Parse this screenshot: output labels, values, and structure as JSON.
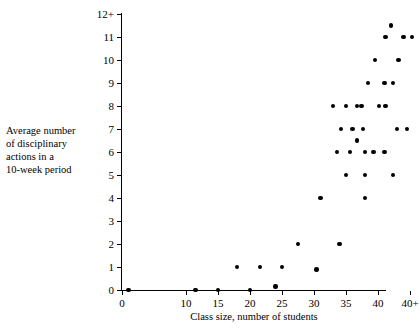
{
  "chart_data": {
    "type": "scatter",
    "title": "",
    "xlabel": "Class size, number of students",
    "ylabel": "Average number\nof disciplinary\nactions in a\n10-week period",
    "ylabel_lines": [
      "Average number",
      "of disciplinary",
      "actions in a",
      "10-week period"
    ],
    "xticks": [
      0,
      10,
      15,
      20,
      25,
      30,
      35,
      40,
      45
    ],
    "xticklabels": [
      "0",
      "10",
      "15",
      "20",
      "25",
      "30",
      "35",
      "40",
      "40+"
    ],
    "yticks": [
      0,
      1,
      2,
      3,
      4,
      5,
      6,
      7,
      8,
      9,
      10,
      11,
      12
    ],
    "yticklabels": [
      "0",
      "1",
      "2",
      "3",
      "4",
      "5",
      "6",
      "7",
      "8",
      "9",
      "10",
      "11",
      "12+"
    ],
    "xlim": [
      -2,
      47
    ],
    "ylim": [
      0,
      12.3
    ],
    "grid": false,
    "legend": null,
    "marker": "filled-circle",
    "marker_color": "#000000",
    "points": [
      {
        "x": 1.0,
        "y": 0
      },
      {
        "x": 11.5,
        "y": 0
      },
      {
        "x": 15.0,
        "y": 0
      },
      {
        "x": 20.0,
        "y": 0
      },
      {
        "x": 24.0,
        "y": 0.15
      },
      {
        "x": 18.0,
        "y": 1
      },
      {
        "x": 21.6,
        "y": 1
      },
      {
        "x": 25.0,
        "y": 1
      },
      {
        "x": 30.4,
        "y": 0.9
      },
      {
        "x": 27.5,
        "y": 2
      },
      {
        "x": 34.0,
        "y": 2
      },
      {
        "x": 31.0,
        "y": 4
      },
      {
        "x": 38.0,
        "y": 4
      },
      {
        "x": 35.0,
        "y": 5
      },
      {
        "x": 38.0,
        "y": 5
      },
      {
        "x": 42.3,
        "y": 5
      },
      {
        "x": 33.6,
        "y": 6
      },
      {
        "x": 35.6,
        "y": 6
      },
      {
        "x": 38.0,
        "y": 6
      },
      {
        "x": 39.3,
        "y": 6
      },
      {
        "x": 41.0,
        "y": 6
      },
      {
        "x": 36.7,
        "y": 6.5
      },
      {
        "x": 34.2,
        "y": 7
      },
      {
        "x": 36.0,
        "y": 7
      },
      {
        "x": 37.7,
        "y": 7
      },
      {
        "x": 43.0,
        "y": 7
      },
      {
        "x": 44.5,
        "y": 7
      },
      {
        "x": 33.0,
        "y": 8
      },
      {
        "x": 35.0,
        "y": 8
      },
      {
        "x": 36.7,
        "y": 8
      },
      {
        "x": 37.4,
        "y": 8
      },
      {
        "x": 40.2,
        "y": 8
      },
      {
        "x": 41.2,
        "y": 8
      },
      {
        "x": 38.4,
        "y": 9
      },
      {
        "x": 41.0,
        "y": 9
      },
      {
        "x": 42.3,
        "y": 9
      },
      {
        "x": 39.5,
        "y": 10
      },
      {
        "x": 43.2,
        "y": 10
      },
      {
        "x": 41.2,
        "y": 11
      },
      {
        "x": 44.0,
        "y": 11
      },
      {
        "x": 45.3,
        "y": 11
      },
      {
        "x": 42.0,
        "y": 11.5
      }
    ]
  }
}
